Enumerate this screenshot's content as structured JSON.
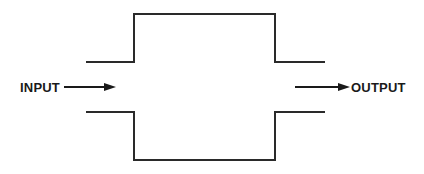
{
  "diagram": {
    "type": "block-flow",
    "input_label": "INPUT",
    "output_label": "OUTPUT",
    "stroke_color": "#2a2a2a",
    "background_color": "#ffffff"
  }
}
